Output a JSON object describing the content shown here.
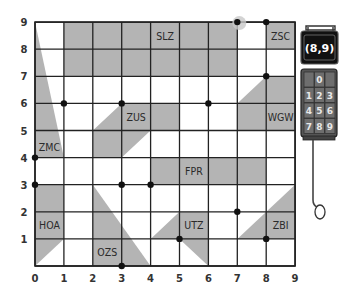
{
  "grid": {
    "x_ticks": [
      "0",
      "1",
      "2",
      "3",
      "4",
      "5",
      "6",
      "7",
      "8",
      "9"
    ],
    "y_ticks": [
      "0",
      "1",
      "2",
      "3",
      "4",
      "5",
      "6",
      "7",
      "8",
      "9"
    ],
    "x_min": 0,
    "x_max": 9,
    "y_min": 0,
    "y_max": 9
  },
  "regions": [
    {
      "label": "SLZ",
      "points": [
        [
          1,
          9
        ],
        [
          7,
          9
        ],
        [
          7,
          7
        ],
        [
          1,
          7
        ]
      ],
      "label_at": [
        4.5,
        8.5
      ]
    },
    {
      "label": "ZSC",
      "points": [
        [
          8,
          9
        ],
        [
          9,
          9
        ],
        [
          9,
          8
        ],
        [
          8,
          8
        ]
      ],
      "label_at": [
        8.5,
        8.5
      ]
    },
    {
      "label": "ZMC",
      "points": [
        [
          0,
          9
        ],
        [
          0,
          4
        ],
        [
          1,
          4
        ]
      ],
      "label_at": [
        0.5,
        4.4
      ]
    },
    {
      "label": "ZUS",
      "points": [
        [
          2,
          4
        ],
        [
          2,
          5
        ],
        [
          3,
          6
        ],
        [
          5,
          6
        ],
        [
          5,
          5
        ],
        [
          4,
          5
        ],
        [
          3,
          4
        ]
      ],
      "label_at": [
        3.5,
        5.5
      ]
    },
    {
      "label": "WGW",
      "points": [
        [
          7,
          5
        ],
        [
          7,
          6
        ],
        [
          8,
          7
        ],
        [
          9,
          7
        ],
        [
          9,
          5
        ]
      ],
      "label_at": [
        8.5,
        5.5
      ]
    },
    {
      "label": "FPR",
      "points": [
        [
          4,
          4
        ],
        [
          8,
          4
        ],
        [
          8,
          3
        ],
        [
          4,
          3
        ]
      ],
      "label_at": [
        5.5,
        3.5
      ]
    },
    {
      "label": "HOA",
      "points": [
        [
          0,
          0
        ],
        [
          0,
          3
        ],
        [
          1,
          3
        ],
        [
          1,
          1
        ]
      ],
      "label_at": [
        0.5,
        1.5
      ]
    },
    {
      "label": "OZS",
      "points": [
        [
          2,
          0
        ],
        [
          2,
          3
        ],
        [
          4,
          0
        ]
      ],
      "label_at": [
        2.5,
        0.5
      ]
    },
    {
      "label": "UTZ",
      "points": [
        [
          4,
          1
        ],
        [
          5,
          2
        ],
        [
          6,
          2
        ],
        [
          6,
          0
        ],
        [
          5,
          1
        ]
      ],
      "label_at": [
        5.5,
        1.5
      ]
    },
    {
      "label": "ZBI",
      "points": [
        [
          7,
          1
        ],
        [
          9,
          3
        ],
        [
          9,
          1
        ]
      ],
      "label_at": [
        8.5,
        1.5
      ]
    }
  ],
  "points": [
    [
      0,
      4
    ],
    [
      0,
      3
    ],
    [
      1,
      6
    ],
    [
      3,
      6
    ],
    [
      3,
      3
    ],
    [
      4,
      3
    ],
    [
      3,
      0
    ],
    [
      5,
      1
    ],
    [
      6,
      6
    ],
    [
      7,
      2
    ],
    [
      7,
      9
    ],
    [
      8,
      9
    ],
    [
      8,
      7
    ],
    [
      8,
      1
    ]
  ],
  "highlighted_point": [
    7,
    9
  ],
  "device": {
    "display": "(8,9)",
    "keypad": [
      [
        "",
        "0",
        ""
      ],
      [
        "1",
        "2",
        "3"
      ],
      [
        "4",
        "5",
        "6"
      ],
      [
        "7",
        "8",
        "9"
      ]
    ]
  },
  "colors": {
    "region_fill": "#b4b4b4",
    "grid": "#222222",
    "device_body": "#555555",
    "display_bg": "#111111"
  }
}
